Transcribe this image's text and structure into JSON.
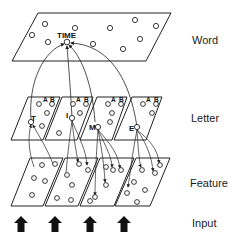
{
  "colors": {
    "stroke": "#222222",
    "background": "#ffffff",
    "arrow_fill": "#111111"
  },
  "labels": {
    "word": "Word",
    "letter": "Letter",
    "feature": "Feature",
    "input": "Input"
  },
  "word_layer": {
    "node_label": "TIME"
  },
  "letter_layer": {
    "panels": [
      {
        "letter": "T",
        "a": "A",
        "b": "B"
      },
      {
        "letter": "I",
        "a": "A",
        "b": "B"
      },
      {
        "letter": "M",
        "a": "A",
        "b": "B"
      },
      {
        "letter": "E",
        "a": "A",
        "b": "B"
      }
    ]
  },
  "feature_layer": {
    "panel_count": 4
  },
  "input": {
    "arrow_count": 4
  }
}
